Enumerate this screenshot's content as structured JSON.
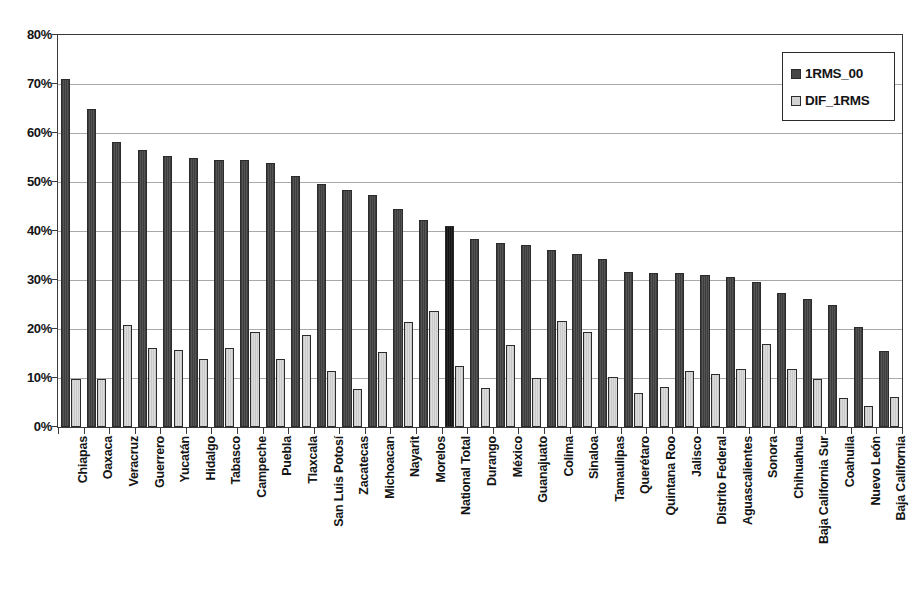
{
  "chart_data": {
    "type": "bar",
    "title": "",
    "subtitle": "",
    "xlabel": "",
    "ylabel": "",
    "ylim": [
      0,
      80
    ],
    "y_tick_labels": [
      "0%",
      "10%",
      "20%",
      "30%",
      "40%",
      "50%",
      "60%",
      "70%",
      "80%"
    ],
    "y_tick_values": [
      0,
      10,
      20,
      30,
      40,
      50,
      60,
      70,
      80
    ],
    "grid": true,
    "legend_position": "top-right",
    "categories": [
      "Chiapas",
      "Oaxaca",
      "Veracruz",
      "Guerrero",
      "Yucatán",
      "Hidalgo",
      "Tabasco",
      "Campeche",
      "Puebla",
      "Tlaxcala",
      "San Luis Potosí",
      "Zacatecas",
      "Michoacan",
      "Nayarit",
      "Morelos",
      "National Total",
      "Durango",
      "México",
      "Guanajuato",
      "Colima",
      "Sinaloa",
      "Tamaulipas",
      "Querétaro",
      "Quintana Roo",
      "Jalisco",
      "Distrito Federal",
      "Aguascalientes",
      "Sonora",
      "Chihuahua",
      "Baja California Sur",
      "Coahuila",
      "Nuevo León",
      "Baja California"
    ],
    "highlight_category": "National Total",
    "series": [
      {
        "name": "1RMS_00",
        "color": "#474747",
        "values": [
          71.0,
          65.0,
          58.2,
          56.6,
          55.4,
          55.0,
          54.5,
          54.4,
          53.8,
          51.2,
          49.6,
          48.4,
          47.4,
          44.4,
          42.2,
          41.0,
          38.4,
          37.6,
          37.1,
          36.1,
          35.3,
          34.3,
          31.6,
          31.5,
          31.5,
          31.0,
          30.6,
          29.5,
          27.4,
          26.2,
          24.8,
          20.5,
          15.6
        ]
      },
      {
        "name": "DIF_1RMS",
        "color": "#d2d2d2",
        "values": [
          9.7,
          9.9,
          20.8,
          16.2,
          15.8,
          13.8,
          16.2,
          19.3,
          13.8,
          18.8,
          11.5,
          7.8,
          15.4,
          21.5,
          23.6,
          12.5,
          8.0,
          16.7,
          10.1,
          21.7,
          19.4,
          10.2,
          7.0,
          8.2,
          11.5,
          10.8,
          11.8,
          17.0,
          11.8,
          9.9,
          5.9,
          4.2,
          6.1
        ]
      }
    ]
  },
  "legend": {
    "entries": [
      {
        "label": "1RMS_00",
        "swatch": "dark"
      },
      {
        "label": "DIF_1RMS",
        "swatch": "light"
      }
    ]
  }
}
